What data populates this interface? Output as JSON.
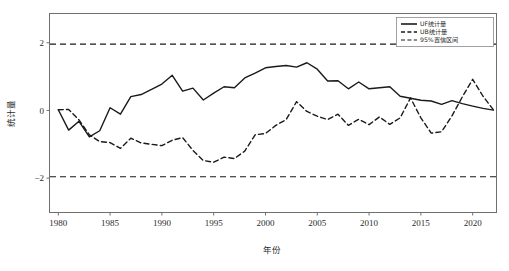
{
  "chart_data": {
    "type": "line",
    "title": "",
    "xlabel": "年份",
    "ylabel": "统计量",
    "xlim": [
      1979.2,
      1922.0
    ],
    "x_range": [
      1979.2,
      2022.3
    ],
    "ylim": [
      -3.0,
      2.85
    ],
    "grid": false,
    "legend_position": "top-right",
    "x_ticks": [
      1980,
      1985,
      1990,
      1995,
      2000,
      2005,
      2010,
      2015,
      2020
    ],
    "x_tick_labels": [
      "1980",
      "1985",
      "1990",
      "1995",
      "2000",
      "2005",
      "2010",
      "2015",
      "2020"
    ],
    "y_ticks": [
      2,
      0,
      -2
    ],
    "y_tick_labels": [
      "2",
      "0",
      "−2"
    ],
    "x": [
      1980,
      1981,
      1982,
      1983,
      1984,
      1985,
      1986,
      1987,
      1988,
      1989,
      1990,
      1991,
      1992,
      1993,
      1994,
      1995,
      1996,
      1997,
      1998,
      1999,
      2000,
      2001,
      2002,
      2003,
      2004,
      2005,
      2006,
      2007,
      2008,
      2009,
      2010,
      2011,
      2012,
      2013,
      2014,
      2015,
      2016,
      2017,
      2018,
      2019,
      2020,
      2021,
      2022
    ],
    "series": [
      {
        "name": "UF统计量",
        "style": "solid",
        "color": "#1a1a1a",
        "values": [
          0.02,
          -0.58,
          -0.32,
          -0.78,
          -0.6,
          0.08,
          -0.11,
          0.41,
          0.47,
          0.62,
          0.78,
          1.04,
          0.57,
          0.66,
          0.31,
          0.51,
          0.7,
          0.67,
          0.96,
          1.1,
          1.26,
          1.3,
          1.33,
          1.28,
          1.41,
          1.22,
          0.87,
          0.88,
          0.64,
          0.84,
          0.64,
          0.67,
          0.7,
          0.42,
          0.36,
          0.3,
          0.28,
          0.18,
          0.29,
          0.2,
          0.13,
          0.06,
          0.01
        ]
      },
      {
        "name": "UB统计量",
        "style": "dashed",
        "color": "#1a1a1a",
        "values": [
          0.02,
          0.03,
          -0.28,
          -0.72,
          -0.92,
          -0.95,
          -1.12,
          -0.82,
          -0.96,
          -1.0,
          -1.04,
          -0.88,
          -0.8,
          -1.18,
          -1.48,
          -1.53,
          -1.38,
          -1.42,
          -1.2,
          -0.72,
          -0.68,
          -0.44,
          -0.27,
          0.26,
          -0.03,
          -0.17,
          -0.27,
          -0.11,
          -0.44,
          -0.26,
          -0.42,
          -0.19,
          -0.41,
          -0.22,
          0.37,
          -0.22,
          -0.67,
          -0.63,
          -0.16,
          0.4,
          0.92,
          0.42,
          0.02
        ]
      }
    ],
    "reference_lines": [
      {
        "name": "95%置信区间",
        "value": 1.96,
        "style": "dashed",
        "color": "#1a1a1a"
      },
      {
        "name": "95%置信区间",
        "value": -1.96,
        "style": "dashed",
        "color": "#1a1a1a"
      }
    ],
    "legend": [
      {
        "label": "UF统计量",
        "style": "solid"
      },
      {
        "label": "UB统计量",
        "style": "dashed"
      },
      {
        "label": "95%置信区间",
        "style": "dashed"
      }
    ]
  }
}
